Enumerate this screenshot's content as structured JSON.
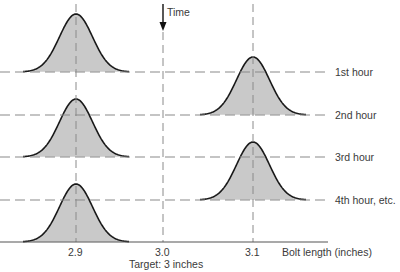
{
  "title": "",
  "time_label": "Time",
  "hour_labels": [
    "1st hour",
    "2nd hour",
    "3rd hour",
    "4th hour, etc."
  ],
  "x_axis": {
    "ticks": [
      {
        "label": "2.9",
        "x": 76
      },
      {
        "label": "3.0",
        "x": 163
      },
      {
        "label": "3.1",
        "x": 253
      }
    ],
    "label": "Bolt length (inches)",
    "target_label": "Target: 3 inches"
  },
  "hour_lines_y": [
    72,
    115,
    157,
    200
  ],
  "axis_y": 242,
  "distributions": [
    {
      "center_value": 2.9,
      "cx": 76,
      "baseline": 72
    },
    {
      "center_value": 3.1,
      "cx": 253,
      "baseline": 115
    },
    {
      "center_value": 2.9,
      "cx": 76,
      "baseline": 157
    },
    {
      "center_value": 3.1,
      "cx": 253,
      "baseline": 200
    },
    {
      "center_value": 2.9,
      "cx": 76,
      "baseline": 242
    }
  ],
  "colors": {
    "fill": "#c9c9c9",
    "curve": "#1a1a1a",
    "dash": "#8a8a8a",
    "axis": "#555555",
    "text": "#3a3a3a"
  }
}
